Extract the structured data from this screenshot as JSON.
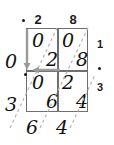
{
  "diagram": {
    "grid": {
      "rows": 2,
      "cols": 2,
      "cells": [
        {
          "id": "r0c0",
          "upper": "0",
          "lower": "2"
        },
        {
          "id": "r0c1",
          "upper": "0",
          "lower": "8"
        },
        {
          "id": "r1c0",
          "upper": "0",
          "lower": "6"
        },
        {
          "id": "r1c1",
          "upper": "2",
          "lower": "4"
        }
      ]
    },
    "top_operand": {
      "decimal_point": ".",
      "digits": [
        "2",
        "8"
      ]
    },
    "right_operand": {
      "digits": [
        "1",
        "3"
      ],
      "decimal_point": "."
    },
    "answer": {
      "left": [
        "0",
        "3"
      ],
      "left_decimal_point": ".",
      "bottom": [
        "6",
        "4"
      ],
      "value": "0.364"
    },
    "colors": {
      "grid_line": "#6f6f6f",
      "diagonal": "#b4b4b4",
      "arrow": "#9a9a9a",
      "ink": "#111111"
    }
  }
}
